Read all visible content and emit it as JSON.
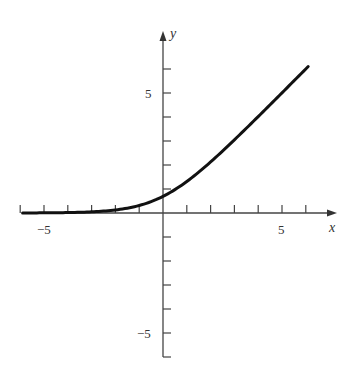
{
  "chart_data": {
    "type": "line",
    "title": "",
    "xlabel": "x",
    "ylabel": "y",
    "xlim": [
      -6,
      7
    ],
    "ylim": [
      -6,
      6
    ],
    "grid": false,
    "legend": null,
    "x_ticks": [
      -6,
      -5,
      -4,
      -3,
      -2,
      -1,
      1,
      2,
      3,
      4,
      5,
      6
    ],
    "y_ticks": [
      -6,
      -5,
      -4,
      -3,
      -2,
      -1,
      1,
      2,
      3,
      4,
      5,
      6
    ],
    "x_tick_labels": [
      {
        "value": -5,
        "label": "−5"
      },
      {
        "value": 5,
        "label": "5"
      }
    ],
    "y_tick_labels": [
      {
        "value": 5,
        "label": "5"
      },
      {
        "value": -5,
        "label": "−5"
      }
    ],
    "series": [
      {
        "name": "y = ln(1 + e^x)",
        "x": [
          -5.9,
          -5,
          -4,
          -3,
          -2,
          -1,
          0,
          1,
          2,
          3,
          4,
          5,
          6.1
        ],
        "values": [
          0.003,
          0.007,
          0.018,
          0.049,
          0.127,
          0.313,
          0.693,
          1.313,
          2.127,
          3.049,
          4.018,
          5.007,
          6.102
        ],
        "color": "#111111"
      }
    ]
  },
  "labels": {
    "x_axis": "x",
    "y_axis": "y",
    "x_neg5": "−5",
    "x_pos5": "5",
    "y_pos5": "5",
    "y_neg5": "−5"
  }
}
